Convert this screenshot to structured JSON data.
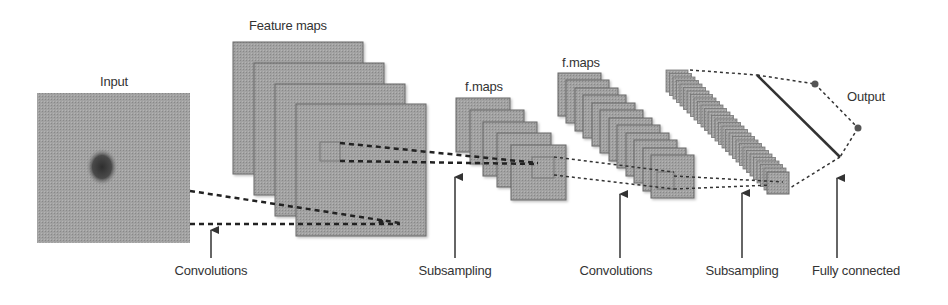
{
  "diagram": {
    "colors": {
      "map_fill": "#9a9a9a",
      "map_edge": "#6a6a6a",
      "input_fill": "#a0a0a0",
      "blob": "#3a3a3a",
      "line": "#333333",
      "text": "#333333"
    },
    "nodes": {
      "input": {
        "label": "Input"
      },
      "feature_maps": {
        "label": "Feature maps",
        "count": 4
      },
      "fmaps_1": {
        "label": "f.maps",
        "count": 5
      },
      "fmaps_2": {
        "label": "f.maps",
        "count": 12
      },
      "subsampled_2": {
        "count": 30
      },
      "output": {
        "label": "Output",
        "count": 2
      }
    },
    "stages": [
      {
        "label": "Convolutions"
      },
      {
        "label": "Subsampling"
      },
      {
        "label": "Convolutions"
      },
      {
        "label": "Subsampling"
      },
      {
        "label": "Fully connected"
      }
    ]
  }
}
